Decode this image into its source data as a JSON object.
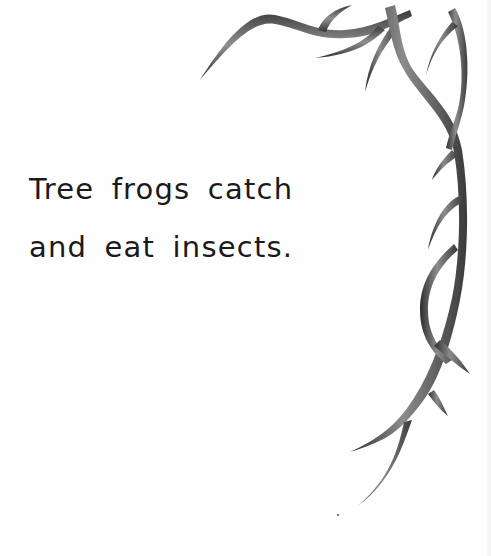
{
  "page": {
    "text_lines": [
      "Tree frogs catch",
      "and eat insects."
    ],
    "illustration": "thorny-vine-branch",
    "colors": {
      "background": "#fefefe",
      "text": "#1a1a1a",
      "vine_dark": "#3a3a3a",
      "vine_light": "#9a9a9a"
    }
  }
}
